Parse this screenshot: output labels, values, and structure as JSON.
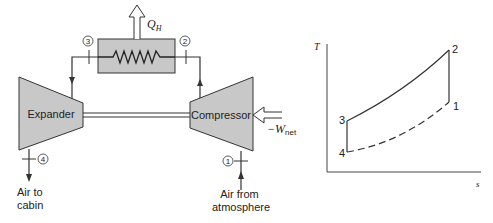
{
  "schematic": {
    "heat_exchanger": {
      "heat_label": "Q",
      "heat_subscript": "H"
    },
    "expander": {
      "label": "Expander"
    },
    "compressor": {
      "label": "Compressor"
    },
    "work": {
      "label": "−W",
      "subscript": "net"
    },
    "states": [
      {
        "id": "1",
        "label": "1"
      },
      {
        "id": "2",
        "label": "2"
      },
      {
        "id": "3",
        "label": "3"
      },
      {
        "id": "4",
        "label": "4"
      }
    ],
    "outlet": {
      "line1": "Air to",
      "line2": "cabin"
    },
    "inlet": {
      "line1": "Air from",
      "line2": "atmosphere"
    }
  },
  "ts_diagram": {
    "y_axis_label": "T",
    "x_axis_label": "s",
    "points": [
      {
        "label": "1",
        "s": 0.95,
        "T": 0.55
      },
      {
        "label": "2",
        "s": 0.95,
        "T": 0.97
      },
      {
        "label": "3",
        "s": 0.1,
        "T": 0.4
      },
      {
        "label": "4",
        "s": 0.1,
        "T": 0.15
      }
    ],
    "processes": [
      {
        "from": "1",
        "to": "2",
        "style": "solid"
      },
      {
        "from": "2",
        "to": "3",
        "style": "solid-curve"
      },
      {
        "from": "3",
        "to": "4",
        "style": "solid"
      },
      {
        "from": "4",
        "to": "1",
        "style": "dashed-curve"
      }
    ]
  },
  "colors": {
    "component_fill": "#c8c8c8",
    "line": "#333333"
  }
}
